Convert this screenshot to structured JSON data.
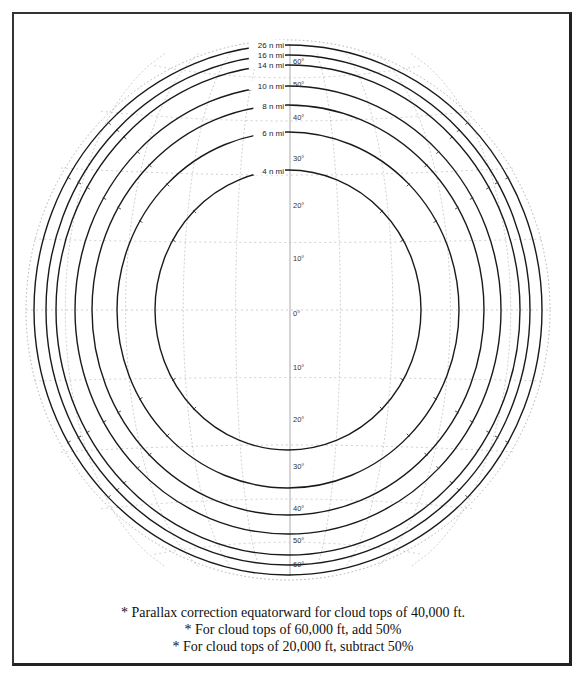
{
  "diagram": {
    "center": {
      "x": 288,
      "y": 310
    },
    "globe": {
      "rx": 262,
      "ry": 270,
      "stroke": "#9a9a9a"
    },
    "range_rings": [
      {
        "label": "4 n mi",
        "rx": 133,
        "ry": 140,
        "label_y": 171
      },
      {
        "label": "6 n mi",
        "rx": 171,
        "ry": 178,
        "label_y": 133
      },
      {
        "label": "8 n mi",
        "rx": 196,
        "ry": 205,
        "label_y": 106
      },
      {
        "label": "10 n mi",
        "rx": 213,
        "ry": 224,
        "label_y": 86
      },
      {
        "label": "14 n mi",
        "rx": 232,
        "ry": 245,
        "label_y": 65
      },
      {
        "label": "16 n mi",
        "rx": 242,
        "ry": 255,
        "label_y": 55
      },
      {
        "label": "26 n mi",
        "rx": 254,
        "ry": 265,
        "label_y": 45
      }
    ],
    "latitude_labels": [
      {
        "text": "60°",
        "y": 61
      },
      {
        "text": "50°",
        "y": 84
      },
      {
        "text": "40°",
        "y": 117
      },
      {
        "text": "30°",
        "y": 158
      },
      {
        "text": "20°",
        "y": 205
      },
      {
        "text": "10°",
        "y": 258
      },
      {
        "text": "0°",
        "y": 313
      },
      {
        "text": "10°",
        "y": 367
      },
      {
        "text": "20°",
        "y": 419
      },
      {
        "text": "30°",
        "y": 466
      },
      {
        "text": "40°",
        "y": 508
      },
      {
        "text": "50°",
        "y": 540
      },
      {
        "text": "60°",
        "y": 564
      }
    ],
    "ring_color": "#1a1a1a",
    "grid_color": "#b0b0b0"
  },
  "notes": [
    "* Parallax correction equatorward for cloud tops of 40,000 ft.",
    "* For cloud tops of 60,000 ft, add 50%",
    "* For cloud tops of 20,000 ft, subtract 50%"
  ]
}
